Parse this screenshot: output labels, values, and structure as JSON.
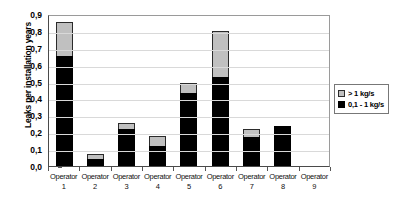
{
  "chart_data": {
    "type": "bar",
    "stacked": true,
    "title": "",
    "xlabel": "",
    "ylabel": "Leaks per installation years",
    "ylim": [
      0.0,
      0.9
    ],
    "ytick_labels": [
      "0,9",
      "0,8",
      "0,7",
      "0,6",
      "0,5",
      "0,4",
      "0,3",
      "0,2",
      "0,1",
      "0,0"
    ],
    "ytick_values": [
      0.9,
      0.8,
      0.7,
      0.6,
      0.5,
      0.4,
      0.3,
      0.2,
      0.1,
      0.0
    ],
    "grid": true,
    "legend_position": "right",
    "categories": [
      "Operator 1",
      "Operator 2",
      "Operator 3",
      "Operator 4",
      "Operator 5",
      "Operator 6",
      "Operator 7",
      "Operator 8",
      "Operator 9"
    ],
    "category_lines": [
      {
        "name": "Operator",
        "num": "1"
      },
      {
        "name": "Operator",
        "num": "2"
      },
      {
        "name": "Operator",
        "num": "3"
      },
      {
        "name": "Operator",
        "num": "4"
      },
      {
        "name": "Operator",
        "num": "5"
      },
      {
        "name": "Operator",
        "num": "6"
      },
      {
        "name": "Operator",
        "num": "7"
      },
      {
        "name": "Operator",
        "num": "8"
      },
      {
        "name": "Operator",
        "num": "9"
      }
    ],
    "series": [
      {
        "name": "0,1 - 1 kg/s",
        "color": "#000000",
        "values": [
          0.65,
          0.04,
          0.22,
          0.12,
          0.43,
          0.53,
          0.17,
          0.235,
          0.0
        ]
      },
      {
        "name": "> 1 kg/s",
        "color": "#c0c0c0",
        "values": [
          0.205,
          0.03,
          0.035,
          0.06,
          0.06,
          0.27,
          0.05,
          0.0,
          0.0
        ]
      }
    ],
    "totals": [
      0.855,
      0.07,
      0.255,
      0.18,
      0.49,
      0.8,
      0.22,
      0.235,
      0.0
    ]
  },
  "legend": {
    "items": [
      {
        "label": "> 1 kg/s",
        "swatch": "gray"
      },
      {
        "label": "0,1 - 1 kg/s",
        "swatch": "black"
      }
    ]
  }
}
